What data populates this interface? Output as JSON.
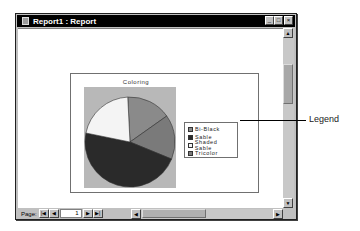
{
  "window": {
    "title": "Report1 : Report",
    "controls": {
      "minimize": "_",
      "maximize": "□",
      "close": "×"
    }
  },
  "navigation": {
    "page_label": "Page:",
    "current_page": "1",
    "buttons": {
      "first": "|◀",
      "prev": "◀",
      "next": "▶",
      "last": "▶|"
    }
  },
  "scrollbars": {
    "up": "▲",
    "down": "▼",
    "left": "◀",
    "right": "▶"
  },
  "callout": {
    "label": "Legend"
  },
  "chart_data": {
    "type": "pie",
    "title": "Coloring",
    "categories": [
      "Bi-Black",
      "Sable",
      "Shaded Sable",
      "Tricolor"
    ],
    "values": [
      16,
      47,
      21,
      16
    ],
    "colors": [
      "#8a8a8a",
      "#2a2a2a",
      "#f4f4f4",
      "#7a7a7a"
    ],
    "legend_position": "right",
    "plot_background": "#b8b8b8"
  },
  "legend": {
    "items": [
      {
        "label": "Bi-Black",
        "color": "#8a8a8a"
      },
      {
        "label": "Sable",
        "color": "#2a2a2a"
      },
      {
        "label": "Shaded Sable",
        "color": "#f4f4f4"
      },
      {
        "label": "Tricolor",
        "color": "#7a7a7a"
      }
    ]
  }
}
